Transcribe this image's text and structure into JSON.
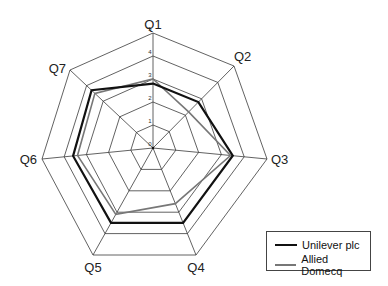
{
  "chart_data": {
    "type": "radar",
    "title": "",
    "categories": [
      "Q1",
      "Q2",
      "Q3",
      "Q4",
      "Q5",
      "Q6",
      "Q7"
    ],
    "range": [
      0,
      5
    ],
    "ticks": [
      "0",
      "1",
      "2",
      "3",
      "4",
      "5"
    ],
    "grid": true,
    "legend_position": "bottom-right",
    "series": [
      {
        "name": "Unilever plc",
        "color": "#111111",
        "line_width": 2.2,
        "values": [
          2.8,
          2.8,
          3.5,
          3.5,
          3.5,
          3.6,
          3.7
        ]
      },
      {
        "name": "Allied Domecq",
        "color": "#777777",
        "line_width": 1.6,
        "values": [
          3.0,
          2.2,
          3.4,
          2.6,
          3.1,
          3.4,
          3.5
        ]
      }
    ]
  },
  "legend": {
    "items": [
      {
        "label": "Unilever plc",
        "color": "#111111"
      },
      {
        "label": "Allied Domecq",
        "color": "#777777"
      }
    ]
  }
}
